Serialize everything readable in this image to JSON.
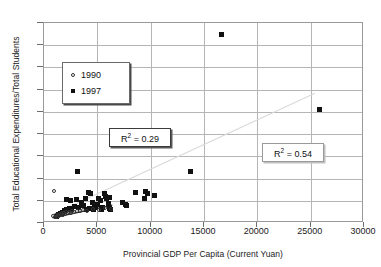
{
  "chart_data": {
    "type": "scatter",
    "title": "",
    "xlabel": "Provincial GDP Per Capita (Current Yuan)",
    "ylabel": "Total Educational Expenditures/Total Students",
    "xlim": [
      0,
      30000
    ],
    "ylim": [
      0,
      4500
    ],
    "xticks": [
      0,
      5000,
      10000,
      15000,
      20000,
      25000,
      30000
    ],
    "yticks": [
      0,
      500,
      1000,
      1500,
      2000,
      2500,
      3000,
      3500,
      4000,
      4500
    ],
    "grid": true,
    "legend_position": "upper-left-inside",
    "series": [
      {
        "name": "1990",
        "marker": "open-circle",
        "color": "#333333",
        "points": [
          [
            1000,
            720
          ],
          [
            900,
            150
          ],
          [
            1050,
            135
          ],
          [
            1150,
            160
          ],
          [
            1250,
            120
          ],
          [
            1350,
            175
          ],
          [
            1450,
            145
          ],
          [
            1500,
            195
          ],
          [
            1600,
            165
          ],
          [
            1700,
            205
          ],
          [
            1800,
            180
          ],
          [
            1900,
            215
          ],
          [
            2000,
            190
          ],
          [
            2100,
            230
          ],
          [
            2250,
            205
          ],
          [
            2400,
            245
          ],
          [
            2550,
            220
          ],
          [
            2700,
            255
          ],
          [
            2900,
            235
          ],
          [
            3100,
            270
          ],
          [
            3400,
            250
          ],
          [
            3700,
            285
          ],
          [
            4100,
            265
          ],
          [
            4600,
            300
          ],
          [
            5200,
            290
          ],
          [
            5800,
            320
          ],
          [
            6300,
            310
          ]
        ]
      },
      {
        "name": "1997",
        "marker": "filled-square",
        "color": "#111111",
        "points": [
          [
            16600,
            4250
          ],
          [
            25800,
            2550
          ],
          [
            13700,
            1170
          ],
          [
            3100,
            1150
          ],
          [
            2100,
            540
          ],
          [
            2450,
            500
          ],
          [
            3050,
            520
          ],
          [
            3500,
            470
          ],
          [
            3900,
            545
          ],
          [
            4150,
            690
          ],
          [
            4400,
            660
          ],
          [
            4500,
            455
          ],
          [
            4700,
            395
          ],
          [
            4850,
            355
          ],
          [
            5100,
            545
          ],
          [
            5250,
            500
          ],
          [
            5500,
            360
          ],
          [
            5700,
            660
          ],
          [
            5750,
            600
          ],
          [
            5900,
            560
          ],
          [
            6100,
            580
          ],
          [
            6150,
            330
          ],
          [
            6250,
            300
          ],
          [
            7400,
            455
          ],
          [
            7600,
            420
          ],
          [
            7700,
            395
          ],
          [
            8600,
            680
          ],
          [
            9400,
            545
          ],
          [
            9500,
            700
          ],
          [
            9700,
            670
          ],
          [
            10400,
            610
          ],
          [
            1150,
            150
          ],
          [
            1350,
            185
          ],
          [
            1550,
            215
          ],
          [
            1750,
            245
          ],
          [
            1950,
            275
          ],
          [
            2150,
            300
          ],
          [
            2350,
            335
          ],
          [
            2600,
            300
          ],
          [
            2850,
            370
          ],
          [
            3250,
            345
          ],
          [
            3700,
            390
          ],
          [
            4000,
            300
          ],
          [
            4300,
            330
          ],
          [
            4600,
            310
          ],
          [
            5000,
            420
          ],
          [
            5400,
            300
          ],
          [
            6000,
            440
          ]
        ]
      }
    ],
    "trendlines": [
      {
        "name": "1990-fit",
        "style": "solid-dark",
        "color": "#222222",
        "x_start": 800,
        "y_start": 115,
        "x_end": 6400,
        "y_end": 400
      },
      {
        "name": "1997-fit",
        "style": "solid-light",
        "color": "#d9d9d9",
        "x_start": 700,
        "y_start": 180,
        "x_end": 25400,
        "y_end": 2920
      }
    ],
    "annotations": [
      {
        "name": "r2-1990",
        "prefix": "R",
        "sup": "2",
        "text": " = 0.29",
        "full": "R2 = 0.29"
      },
      {
        "name": "r2-1997",
        "prefix": "R",
        "sup": "2",
        "text": " = 0.54",
        "full": "R2 = 0.54"
      }
    ]
  },
  "legend": {
    "items": [
      {
        "label": "1990",
        "marker": "open-circle"
      },
      {
        "label": "1997",
        "marker": "filled-square"
      }
    ]
  },
  "axes": {
    "y_title": "Total Educational Expenditures/Total Students",
    "x_title": "Provincial GDP Per Capita (Current Yuan)",
    "y_labels": [
      "4500",
      "4000",
      "3500",
      "3000",
      "2500",
      "2000",
      "1500",
      "1000",
      "500",
      "0"
    ],
    "x_labels": [
      "0",
      "5000",
      "10000",
      "15000",
      "20000",
      "25000",
      "30000"
    ]
  },
  "r2": {
    "first_prefix": "R",
    "first_sup": "2",
    "first_value": " = 0.29",
    "second_prefix": "R",
    "second_sup": "2",
    "second_value": " = 0.54"
  }
}
